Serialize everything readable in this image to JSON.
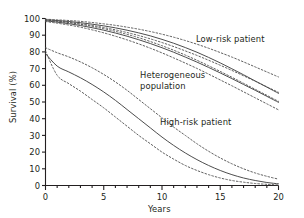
{
  "chart_data": {
    "type": "line",
    "title": "",
    "xlabel": "Years",
    "ylabel": "Survival (%)",
    "xlim": [
      0,
      20
    ],
    "ylim": [
      0,
      100
    ],
    "xticks": [
      0,
      5,
      10,
      15,
      20
    ],
    "xtick_labels": [
      "0",
      "5",
      "10",
      "15",
      "20"
    ],
    "xminor_step": 1,
    "yticks": [
      0,
      10,
      20,
      30,
      40,
      50,
      60,
      70,
      80,
      90,
      100
    ],
    "ytick_labels": [
      "0",
      "10",
      "20",
      "30",
      "40",
      "50",
      "60",
      "70",
      "80",
      "90",
      "100"
    ],
    "grid": false,
    "legend_position": "inline-annotations",
    "line_color": "#4d4d4d",
    "annotations": [
      {
        "name": "low-risk-patient",
        "text": "Low-risk patient",
        "x": 13.0,
        "y": 78
      },
      {
        "name": "heterogeneous-population",
        "text": "Heterogeneous population",
        "x": 8.2,
        "y": 62
      },
      {
        "name": "high-risk-patient",
        "text": "High-risk patient",
        "x": 9.9,
        "y": 38
      }
    ],
    "x": [
      0,
      1,
      2,
      3,
      4,
      5,
      6,
      7,
      8,
      9,
      10,
      11,
      12,
      13,
      14,
      15,
      16,
      17,
      18,
      19,
      20
    ],
    "series": [
      {
        "name": "Low-risk patient",
        "style": "solid",
        "role": "estimate",
        "values": [
          99.3,
          98.8,
          98.2,
          97.5,
          96.6,
          95.6,
          94.4,
          93.0,
          91.4,
          89.6,
          87.5,
          85.2,
          82.6,
          79.8,
          76.7,
          73.4,
          69.9,
          66.3,
          62.6,
          58.9,
          55.2
        ]
      },
      {
        "name": "Low-risk patient upper CI",
        "style": "dashed",
        "role": "ci-upper",
        "values": [
          99.6,
          99.2,
          98.8,
          98.3,
          97.6,
          96.8,
          95.9,
          94.8,
          93.6,
          92.2,
          90.6,
          88.8,
          86.8,
          84.6,
          82.2,
          79.6,
          76.9,
          74.0,
          71.0,
          68.0,
          65.0
        ]
      },
      {
        "name": "Low-risk patient lower CI",
        "style": "dashed",
        "role": "ci-lower",
        "values": [
          99.0,
          98.3,
          97.5,
          96.5,
          95.3,
          93.9,
          92.3,
          90.5,
          88.5,
          86.2,
          83.7,
          81.0,
          78.1,
          75.0,
          71.7,
          68.3,
          64.8,
          61.2,
          57.6,
          54.0,
          50.4
        ]
      },
      {
        "name": "Heterogeneous population",
        "style": "solid",
        "role": "estimate",
        "values": [
          98.6,
          97.8,
          96.9,
          95.8,
          94.5,
          93.0,
          91.3,
          89.4,
          87.3,
          85.0,
          82.5,
          79.8,
          76.9,
          73.9,
          70.7,
          67.4,
          64.0,
          60.5,
          57.0,
          53.4,
          49.8
        ]
      },
      {
        "name": "Heterogeneous population upper CI",
        "style": "dashed",
        "role": "ci-upper",
        "values": [
          99.0,
          98.4,
          97.7,
          96.8,
          95.8,
          94.6,
          93.2,
          91.6,
          89.8,
          87.8,
          85.6,
          83.2,
          80.6,
          77.9,
          75.0,
          72.0,
          68.9,
          65.7,
          62.4,
          59.1,
          55.8
        ]
      },
      {
        "name": "Heterogeneous population lower CI",
        "style": "dashed",
        "role": "ci-lower",
        "values": [
          98.2,
          97.2,
          96.1,
          94.8,
          93.2,
          91.4,
          89.4,
          87.2,
          84.8,
          82.2,
          79.4,
          76.4,
          73.3,
          70.1,
          66.7,
          63.2,
          59.7,
          56.1,
          52.5,
          48.9,
          45.3
        ]
      },
      {
        "name": "High-risk patient",
        "style": "solid",
        "role": "estimate",
        "values": [
          79.0,
          71.5,
          68.0,
          64.5,
          60.5,
          56.0,
          51.0,
          45.5,
          40.0,
          34.5,
          29.0,
          24.0,
          19.5,
          15.5,
          12.0,
          9.0,
          6.5,
          4.5,
          3.0,
          1.8,
          1.0
        ]
      },
      {
        "name": "High-risk patient upper CI",
        "style": "dashed",
        "role": "ci-upper",
        "values": [
          82.5,
          79.5,
          77.0,
          74.0,
          70.5,
          66.5,
          62.0,
          57.0,
          51.5,
          46.0,
          40.5,
          35.0,
          30.0,
          25.0,
          20.5,
          16.5,
          13.0,
          10.0,
          7.5,
          5.5,
          3.8
        ]
      },
      {
        "name": "High-risk patient lower CI",
        "style": "dashed",
        "role": "ci-lower",
        "values": [
          80.5,
          66.0,
          61.0,
          56.5,
          51.5,
          46.5,
          41.0,
          35.5,
          30.0,
          25.0,
          20.0,
          15.8,
          12.0,
          9.0,
          6.5,
          4.5,
          3.0,
          2.0,
          1.2,
          0.7,
          0.3
        ]
      }
    ]
  }
}
